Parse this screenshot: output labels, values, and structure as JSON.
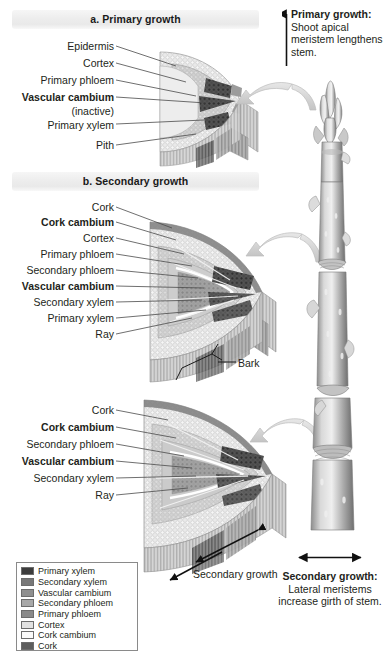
{
  "figure": {
    "panels": [
      {
        "id": "a",
        "header": "a. Primary growth"
      },
      {
        "id": "b",
        "header": "b. Secondary growth"
      }
    ]
  },
  "panel_a": {
    "header": "a. Primary growth",
    "labels": [
      {
        "text": "Epidermis",
        "bold": false
      },
      {
        "text": "Cortex",
        "bold": false
      },
      {
        "text": "Primary phloem",
        "bold": false
      },
      {
        "text": "Vascular cambium",
        "bold": true
      },
      {
        "text": "(inactive)",
        "bold": false
      },
      {
        "text": "Primary xylem",
        "bold": false
      },
      {
        "text": "Pith",
        "bold": false
      }
    ]
  },
  "panel_b": {
    "header": "b. Secondary growth",
    "labels_mid": [
      {
        "text": "Cork",
        "bold": false
      },
      {
        "text": "Cork cambium",
        "bold": true
      },
      {
        "text": "Cortex",
        "bold": false
      },
      {
        "text": "Primary phloem",
        "bold": false
      },
      {
        "text": "Secondary phloem",
        "bold": false
      },
      {
        "text": "Vascular cambium",
        "bold": true
      },
      {
        "text": "Secondary xylem",
        "bold": false
      },
      {
        "text": "Primary xylem",
        "bold": false
      },
      {
        "text": "Ray",
        "bold": false
      }
    ],
    "bark_label": "Bark",
    "labels_lower": [
      {
        "text": "Cork",
        "bold": false
      },
      {
        "text": "Cork cambium",
        "bold": true
      },
      {
        "text": "Secondary phloem",
        "bold": false
      },
      {
        "text": "Vascular cambium",
        "bold": true
      },
      {
        "text": "Secondary xylem",
        "bold": false
      },
      {
        "text": "Ray",
        "bold": false
      }
    ],
    "growth_arrow_label": "Secondary growth"
  },
  "callouts": {
    "primary": {
      "heading": "Primary growth:",
      "body": "Shoot apical meristem lengthens stem."
    },
    "secondary": {
      "heading": "Secondary growth:",
      "body": "Lateral meristems increase girth of stem."
    }
  },
  "legend": {
    "items": [
      {
        "label": "Primary xylem",
        "color": "#3d3d3d"
      },
      {
        "label": "Secondary xylem",
        "color": "#787878"
      },
      {
        "label": "Vascular cambium",
        "color": "#8f8f8f"
      },
      {
        "label": "Secondary phloem",
        "color": "#a8a8a8"
      },
      {
        "label": "Primary phloem",
        "color": "#8a8a8a"
      },
      {
        "label": "Cortex",
        "color": "#e2e2e2"
      },
      {
        "label": "Cork cambium",
        "color": "#fbfbfb"
      },
      {
        "label": "Cork",
        "color": "#5d5d5d"
      }
    ]
  },
  "icons": {
    "up_arrow": "up-arrow-icon",
    "double_arrow_horizontal": "double-arrow-horizontal-icon",
    "double_arrow_diagonal": "double-arrow-diagonal-icon",
    "curved_pointer": "curved-pointer-arrow-icon",
    "bark_bracket": "bracket-icon",
    "twig": "woody-twig-illustration"
  }
}
